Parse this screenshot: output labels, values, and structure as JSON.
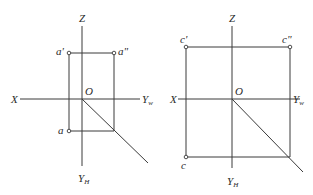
{
  "diagrams": [
    {
      "id": "left",
      "axes": {
        "z": "Z",
        "x": "X",
        "yw": "Y",
        "yw_sub": "w",
        "yh": "Y",
        "yh_sub": "H",
        "origin": "O"
      },
      "points": {
        "front": "a'",
        "side": "a\"",
        "top": "a"
      }
    },
    {
      "id": "right",
      "axes": {
        "z": "Z",
        "x": "X",
        "yw": "Y",
        "yw_sub": "w",
        "yh": "Y",
        "yh_sub": "H",
        "origin": "O"
      },
      "points": {
        "front": "c'",
        "side": "c\"",
        "top": "c"
      }
    }
  ],
  "colors": {
    "line": "#3a3a3a",
    "background": "#ffffff"
  }
}
